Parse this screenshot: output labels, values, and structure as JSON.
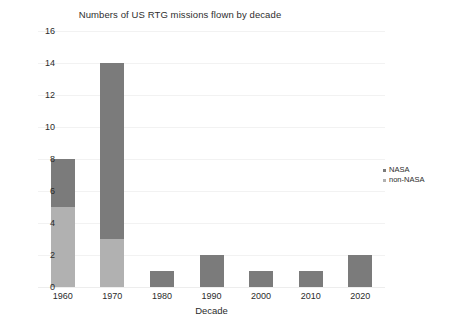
{
  "chart_data": {
    "type": "bar",
    "title": "Numbers of US RTG missions flown by decade",
    "xlabel": "Decade",
    "ylabel": "",
    "stacked": true,
    "grid": true,
    "legend_position": "right",
    "categories": [
      "1960",
      "1970",
      "1980",
      "1990",
      "2000",
      "2010",
      "2020"
    ],
    "ylim": [
      0,
      16
    ],
    "ytick_step": 2,
    "yticks": [
      "16",
      "14",
      "12",
      "10",
      "8",
      "6",
      "4",
      "2",
      "0"
    ],
    "series": [
      {
        "name": "NASA",
        "color": "#7b7b7b",
        "values": [
          3,
          11,
          1,
          2,
          1,
          1,
          2
        ]
      },
      {
        "name": "non-NASA",
        "color": "#b1b1b1",
        "values": [
          5,
          3,
          0,
          0,
          0,
          0,
          0
        ]
      }
    ],
    "totals": [
      8,
      14,
      1,
      2,
      1,
      1,
      2
    ]
  },
  "colors": {
    "nasa": "#7b7b7b",
    "non_nasa": "#b1b1b1",
    "grid": "#f2f2f2",
    "text": "#2b2b2b",
    "background": "#ffffff"
  }
}
